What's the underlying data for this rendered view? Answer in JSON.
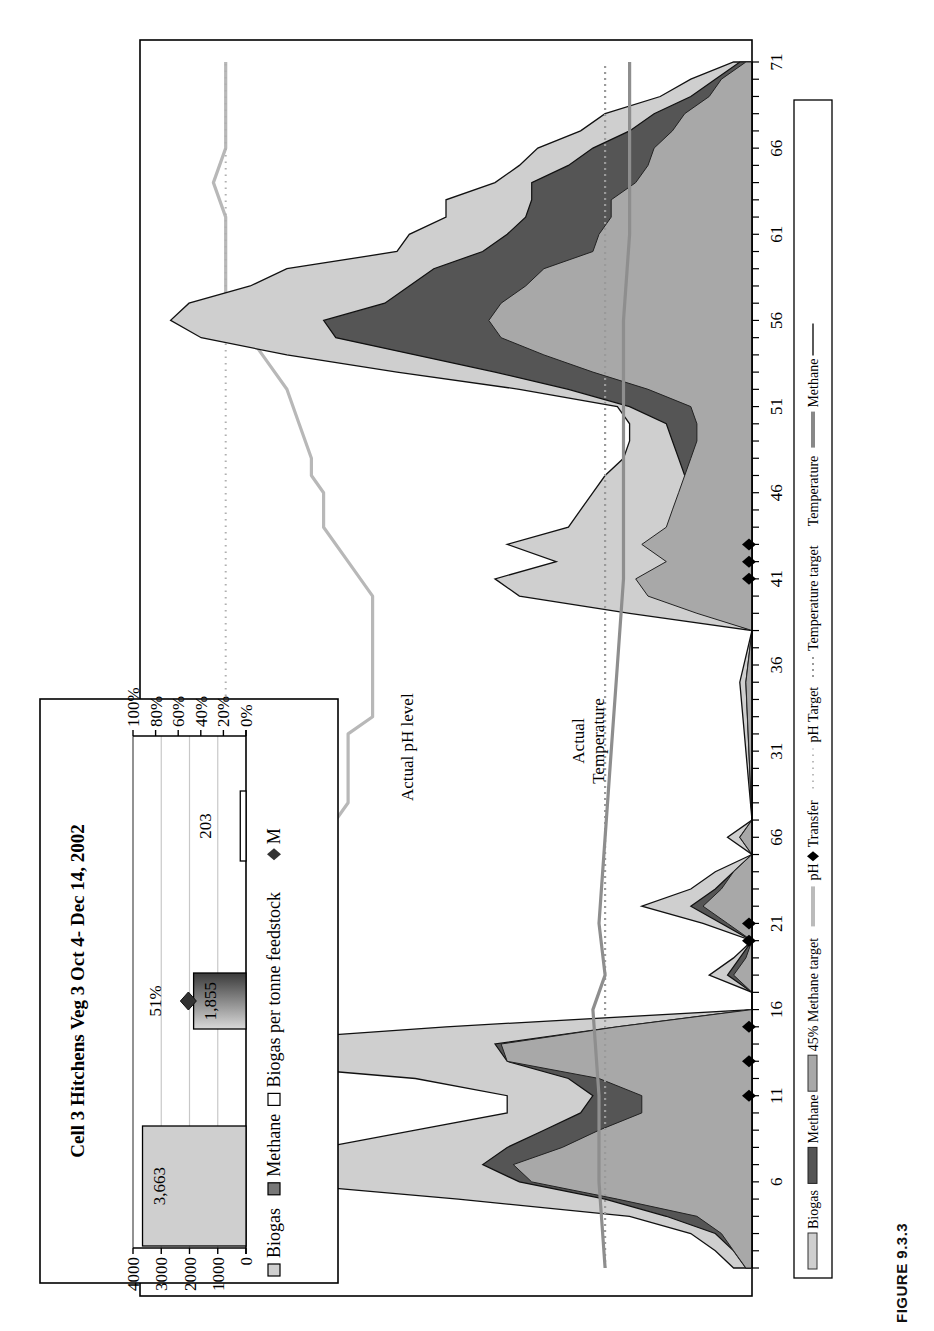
{
  "figure": {
    "label": "FIGURE 9.3.3",
    "orientation": "rotated 90° counter-clockwise on page"
  },
  "chart_data": [
    {
      "id": "main-chart",
      "type": "area",
      "title": "",
      "xlabel": "Day",
      "ylabel": "",
      "x_ticks": [
        "6",
        "11",
        "16",
        "21",
        "66",
        "31",
        "36",
        "41",
        "46",
        "51",
        "56",
        "61",
        "66",
        "71"
      ],
      "x_tick_positions": [
        6,
        11,
        16,
        21,
        26,
        31,
        36,
        41,
        46,
        51,
        56,
        61,
        66,
        71
      ],
      "xlim": [
        1,
        71
      ],
      "grid": false,
      "legend_position": "bottom",
      "annotations": [
        "Actual pH level",
        "Actual Temperature"
      ],
      "legend": [
        {
          "label": "Biogas",
          "style": "light-gray area"
        },
        {
          "label": "Methane",
          "style": "dark-gray area"
        },
        {
          "label": "45% Methane target",
          "style": "gray area"
        },
        {
          "label": "pH",
          "style": "light-gray thick line"
        },
        {
          "label": "Transfer",
          "style": "black diamond marker"
        },
        {
          "label": "pH Target",
          "style": "dotted light-gray line"
        },
        {
          "label": "Temperature target",
          "style": "dotted gray line"
        },
        {
          "label": "Temperature",
          "style": "thick gray line"
        },
        {
          "label": "Methane",
          "style": "thin black line"
        }
      ],
      "series": [
        {
          "name": "Biogas",
          "x": [
            1,
            2,
            3,
            4,
            5,
            6,
            7,
            8,
            9,
            10,
            11,
            12,
            13,
            14,
            15,
            16,
            17,
            18,
            19,
            20,
            21,
            22,
            23,
            24,
            25,
            26,
            27,
            35,
            38,
            39,
            40,
            41,
            42,
            43,
            44,
            45,
            46,
            47,
            48,
            49,
            50,
            51,
            52,
            53,
            54,
            55,
            56,
            57,
            58,
            59,
            60,
            61,
            62,
            63,
            64,
            65,
            66,
            67,
            68,
            69,
            70,
            71
          ],
          "values": [
            3,
            6,
            10,
            20,
            48,
            80,
            86,
            70,
            55,
            40,
            40,
            55,
            88,
            90,
            50,
            0,
            0,
            7,
            3,
            0,
            8,
            18,
            10,
            6,
            0,
            4,
            0,
            2,
            0,
            20,
            38,
            42,
            32,
            40,
            30,
            28,
            26,
            24,
            21,
            20,
            20,
            22,
            38,
            58,
            76,
            90,
            95,
            92,
            82,
            76,
            58,
            56,
            50,
            50,
            42,
            38,
            35,
            28,
            24,
            15,
            10,
            3
          ]
        },
        {
          "name": "Methane",
          "x": [
            1,
            2,
            3,
            4,
            5,
            6,
            7,
            8,
            9,
            10,
            11,
            12,
            13,
            14,
            15,
            16,
            17,
            18,
            19,
            20,
            21,
            22,
            23,
            24,
            25,
            26,
            27,
            35,
            38,
            39,
            40,
            41,
            42,
            43,
            44,
            45,
            46,
            47,
            48,
            49,
            50,
            51,
            52,
            53,
            54,
            55,
            56,
            57,
            58,
            59,
            60,
            61,
            62,
            63,
            64,
            65,
            66,
            67,
            68,
            69,
            70,
            71
          ],
          "values": [
            1,
            3,
            6,
            14,
            24,
            38,
            44,
            40,
            34,
            28,
            26,
            30,
            40,
            42,
            22,
            0,
            0,
            4,
            2,
            0,
            5,
            10,
            6,
            3,
            0,
            2,
            0,
            1,
            0,
            8,
            14,
            18,
            12,
            14,
            12,
            12,
            10,
            11,
            12,
            13,
            14,
            20,
            30,
            42,
            55,
            68,
            70,
            60,
            56,
            52,
            44,
            40,
            37,
            36,
            36,
            30,
            26,
            20,
            16,
            10,
            6,
            2
          ]
        },
        {
          "name": "45% Methane target",
          "x": [
            1,
            2,
            3,
            4,
            5,
            6,
            7,
            8,
            9,
            10,
            11,
            12,
            13,
            14,
            15,
            16,
            17,
            18,
            19,
            20,
            21,
            22,
            23,
            24,
            25,
            26,
            27,
            35,
            38,
            39,
            40,
            41,
            42,
            43,
            44,
            45,
            46,
            47,
            48,
            49,
            50,
            51,
            52,
            53,
            54,
            55,
            56,
            57,
            58,
            59,
            60,
            61,
            62,
            63,
            64,
            65,
            66,
            67,
            68,
            69,
            70,
            71
          ],
          "values": [
            1,
            3,
            5,
            9,
            22,
            36,
            39,
            31,
            25,
            18,
            18,
            25,
            40,
            41,
            22,
            0,
            0,
            3,
            1,
            0,
            4,
            8,
            5,
            3,
            0,
            2,
            0,
            1,
            0,
            9,
            17,
            19,
            14,
            18,
            14,
            13,
            12,
            11,
            10,
            9,
            9,
            10,
            17,
            26,
            34,
            41,
            43,
            41,
            37,
            34,
            26,
            25,
            23,
            23,
            19,
            17,
            16,
            13,
            11,
            7,
            5,
            1
          ]
        },
        {
          "name": "pH",
          "x": [
            1,
            2,
            4,
            6,
            8,
            10,
            12,
            14,
            15,
            16,
            18,
            20,
            22,
            24,
            26,
            28,
            30,
            32,
            33,
            34,
            36,
            38,
            40,
            42,
            44,
            46,
            47,
            48,
            50,
            52,
            54,
            55,
            56,
            57,
            58,
            60,
            62,
            64,
            66,
            68,
            70,
            71
          ],
          "values": [
            78,
            84,
            86,
            87,
            88,
            88,
            88,
            88,
            82,
            82,
            78,
            78,
            72,
            70,
            70,
            66,
            66,
            66,
            62,
            62,
            62,
            62,
            62,
            66,
            70,
            70,
            72,
            72,
            74,
            76,
            80,
            82,
            84,
            86,
            86,
            86,
            86,
            88,
            86,
            86,
            86,
            86
          ]
        },
        {
          "name": "pH Target",
          "x": [
            1,
            71
          ],
          "values": [
            86,
            86
          ]
        },
        {
          "name": "Temperature",
          "x": [
            1,
            6,
            11,
            16,
            18,
            21,
            26,
            31,
            36,
            41,
            46,
            51,
            56,
            61,
            66,
            71
          ],
          "values": [
            24,
            25,
            25,
            26,
            24,
            25,
            24,
            23,
            22,
            21,
            21,
            21,
            21,
            20,
            20,
            20
          ]
        },
        {
          "name": "Temperature target",
          "x": [
            1,
            71
          ],
          "values": [
            24,
            24
          ]
        },
        {
          "name": "Transfer",
          "x": [
            11,
            13,
            15,
            20,
            21,
            41,
            42,
            43
          ],
          "values": [
            0,
            0,
            0,
            0,
            0,
            0,
            0,
            0
          ]
        }
      ]
    },
    {
      "id": "inset-chart",
      "type": "bar",
      "title": "Cell 3 Hitchens Veg 3 Oct 4- Dec 14, 2002",
      "categories": [
        "Biogas",
        "Methane",
        "Biogas per tonne feedstock"
      ],
      "values": [
        3663,
        1855,
        203
      ],
      "value_labels": [
        "3,663",
        "1,855",
        "203"
      ],
      "ylabel": "",
      "ylim": [
        0,
        4000
      ],
      "y_ticks": [
        "4000",
        "3000",
        "2000",
        "1000",
        "0"
      ],
      "y2_ticks": [
        "100%",
        "80%",
        "60%",
        "40%",
        "20%",
        "0%"
      ],
      "y2lim": [
        0,
        100
      ],
      "marker": {
        "name": "M",
        "value": 51,
        "label": "51%"
      },
      "grid": true,
      "legend_position": "bottom",
      "legend": [
        "Biogas",
        "Methane",
        "Biogas per tonne feedstock",
        "M"
      ]
    }
  ]
}
